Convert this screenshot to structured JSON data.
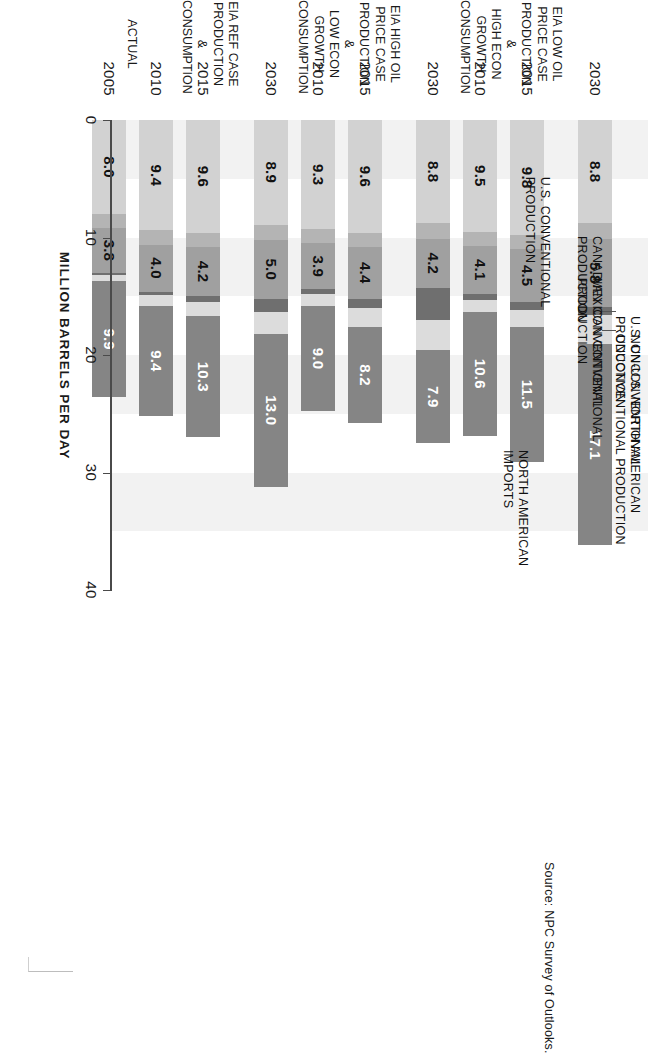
{
  "figure": {
    "source_note": "Source:  NPC Survey of Outlooks.",
    "value_axis_title": "MILLION BARRELS PER DAY"
  },
  "chart_data": {
    "type": "bar",
    "orientation": "horizontal",
    "stacked": true,
    "title": "",
    "xlabel": "MILLION BARRELS PER DAY",
    "ylabel": "",
    "xlim": [
      0,
      40
    ],
    "ticks": [
      0,
      10,
      20,
      30,
      40
    ],
    "tick_labels": [
      "0",
      "10",
      "20",
      "30",
      "40"
    ],
    "grid": false,
    "legend_position": "callouts-above-top-bar",
    "categories": [
      "2005",
      "2010",
      "2015",
      "2030",
      "2010",
      "2015",
      "2030",
      "2010",
      "2015",
      "2030"
    ],
    "groups": [
      {
        "label": "ACTUAL",
        "years": [
          "2005"
        ]
      },
      {
        "label": "EIA REF CASE\nPRODUCTION\n& CONSUMPTION",
        "years": [
          "2010",
          "2015",
          "2030"
        ]
      },
      {
        "label": "EIA HIGH OIL PRICE CASE\nPRODUCTION &\nLOW ECON GROWTH\nCONSUMPTION",
        "years": [
          "2010",
          "2015",
          "2030"
        ]
      },
      {
        "label": "EIA LOW OIL PRICE CASE\nPRODUCTION &\nHIGH ECON GROWTH\nCONSUMPTION",
        "years": [
          "2010",
          "2015",
          "2030"
        ]
      }
    ],
    "series": [
      {
        "name": "U.S. CONVENTIONAL PRODUCTION",
        "color": "#d2d2d2",
        "values": [
          8.0,
          9.4,
          9.6,
          8.9,
          9.3,
          9.6,
          8.8,
          9.5,
          9.8,
          8.8
        ]
      },
      {
        "name": "CANADIAN CONVENTIONAL PRODUCTION",
        "color": "#b4b4b4",
        "values": [
          1.2,
          1.2,
          1.2,
          1.3,
          1.2,
          1.2,
          1.3,
          1.2,
          1.2,
          1.3
        ]
      },
      {
        "name": "MEXICAN CONVENTIONAL PRODUCTION",
        "color": "#a0a0a0",
        "values": [
          3.8,
          4.0,
          4.2,
          5.0,
          3.9,
          4.4,
          4.2,
          4.1,
          4.5,
          5.8
        ]
      },
      {
        "name": "U.S. UNCONVENTIONAL PRODUCTION",
        "color": "#6f6f6f",
        "values": [
          0.2,
          0.3,
          0.5,
          1.1,
          0.4,
          0.8,
          2.7,
          0.5,
          0.7,
          0.7
        ]
      },
      {
        "name": "NON-U.S. NORTH AMERICAN UNCONVENTIONAL PRODUCTION",
        "color": "#dcdcdc",
        "values": [
          0.5,
          0.9,
          1.2,
          1.9,
          1.0,
          1.6,
          2.6,
          1.0,
          1.4,
          2.5
        ]
      },
      {
        "name": "NORTH AMERICAN IMPORTS",
        "color": "#858585",
        "values": [
          9.9,
          9.4,
          10.3,
          13.0,
          9.0,
          8.2,
          7.9,
          10.6,
          11.5,
          17.1
        ]
      }
    ],
    "labeled_values": {
      "north_american_imports": [
        "9.9",
        "9.4",
        "10.3",
        "13.0",
        "9.0",
        "8.2",
        "7.9",
        "10.6",
        "11.5",
        "17.1"
      ],
      "mexican_conventional": [
        "3.8",
        "4.0",
        "4.2",
        "5.0",
        "3.9",
        "4.4",
        "4.2",
        "4.1",
        "4.5",
        "5.8"
      ],
      "us_conventional": [
        "8.0",
        "9.4",
        "9.6",
        "8.9",
        "9.3",
        "9.6",
        "8.8",
        "9.5",
        "9.8",
        "8.8"
      ]
    },
    "callouts": [
      {
        "text": "NORTH AMERICAN\nIMPORTS"
      },
      {
        "text": "NON-U.S. NORTH AMERICAN\nUNCONVENTIONAL PRODUCTION"
      },
      {
        "text": "U.S. UNCONVENTIONAL\nPRODUCTION"
      },
      {
        "text": "MEXICAN CONVENTIONAL\nPRODUCTION"
      },
      {
        "text": "CANADIAN CONVENTIONAL\nPRODUCTION"
      },
      {
        "text": "U.S. CONVENTIONAL\nPRODUCTION"
      }
    ]
  }
}
